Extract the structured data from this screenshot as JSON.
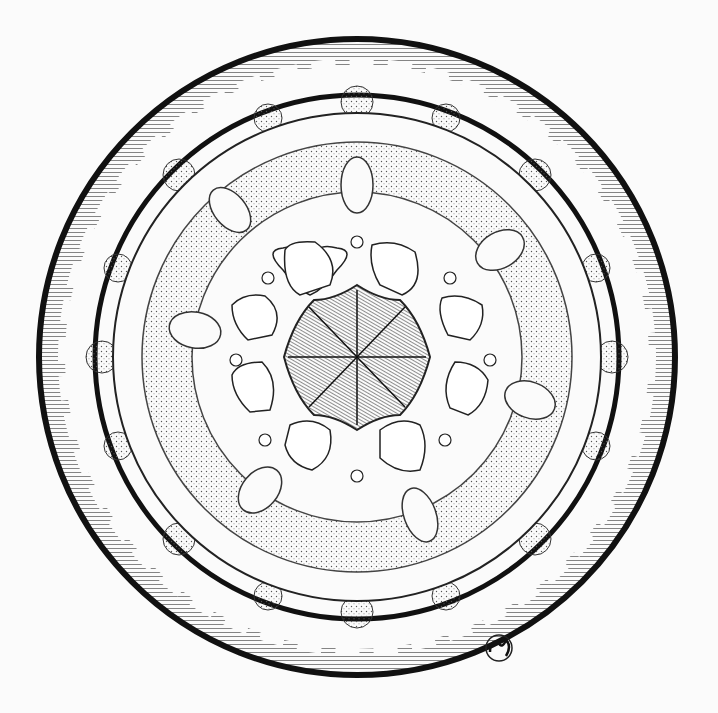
{
  "artwork": {
    "title": "Mandala illustration",
    "medium": "ink pen drawing",
    "colors": {
      "ink": "#1a1a1a",
      "paper": "#fbfbfb",
      "shade": "#7a7a7a",
      "stipple": "#b8b8b8"
    },
    "center": {
      "x": 357,
      "y": 357
    },
    "petals_center": 8,
    "petals_white": 10,
    "signature": "monogram"
  }
}
